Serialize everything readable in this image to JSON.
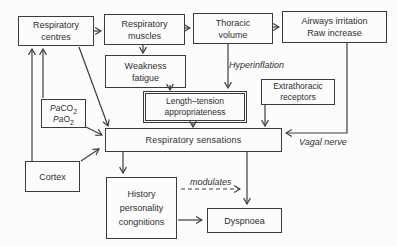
{
  "diagram": {
    "boxes": {
      "respiratory_centres": {
        "line1": "Respiratory",
        "line2": "centres"
      },
      "respiratory_muscles": {
        "line1": "Respiratory",
        "line2": "muscles"
      },
      "thoracic_volume": {
        "line1": "Thoracic",
        "line2": "volume"
      },
      "airways_irritation": {
        "line1": "Airways irritation",
        "line2": "Raw increase"
      },
      "weakness_fatigue": {
        "line1": "Weakness",
        "line2": "fatigue"
      },
      "length_tension": {
        "line1": "Length–tension",
        "line2": "appropriateness"
      },
      "extrathoracic_receptors": {
        "line1": "Extrathoracic",
        "line2": "receptors"
      },
      "paco2": {
        "line1_italic": "Pa",
        "line1_text": "CO",
        "line1_sub": "2",
        "line2_italic": "Pa",
        "line2_text": "O",
        "line2_sub": "2"
      },
      "respiratory_sensations": {
        "label": "Respiratory sensations"
      },
      "cortex": {
        "label": "Cortex"
      },
      "history": {
        "line1": "History",
        "line2": "personality",
        "line3": "congnitions"
      },
      "dyspnoea": {
        "label": "Dyspnoea"
      }
    },
    "labels": {
      "hyperinflation": "Hyperinflation",
      "vagal_nerve": "Vagal nerve",
      "modulates": "modulates"
    },
    "colors": {
      "stroke": "#3c3c3c",
      "background": "#fcfcfc",
      "text": "#2f2f2f"
    }
  }
}
